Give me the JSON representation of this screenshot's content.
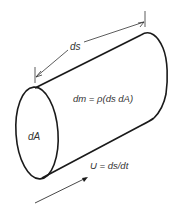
{
  "diagram": {
    "labels": {
      "length": "ds",
      "area": "dA",
      "mass": "dm = ρ(ds dA)",
      "velocity": "U = ds/dt"
    },
    "colors": {
      "stroke": "#1a1a1a",
      "dimension": "#333333",
      "text": "#333333",
      "background": "#ffffff"
    }
  }
}
